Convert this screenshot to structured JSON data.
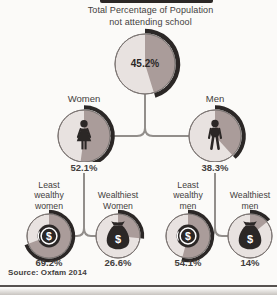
{
  "colors": {
    "bg": "#fbfaf8",
    "light": "#e8e2e0",
    "dark": "#aa9c9a",
    "arc": "#2b2726",
    "outline": "#7d7674",
    "line": "#928e8b",
    "text": "#433e3d",
    "icon-detail": "#ffffff"
  },
  "chart_data": {
    "type": "pie",
    "title_lines": "Total Percentage of Population\nnot attending school",
    "source_label": "Source: Oxfam 2014",
    "unit": "%",
    "legend": "dark wedge and black outer arc span the stated percentage, starting at 12 o'clock clockwise",
    "nodes": [
      {
        "id": "total",
        "label": "",
        "value": 45.2,
        "display": "45.2%",
        "icon": null
      },
      {
        "id": "women",
        "label": "Women",
        "value": 52.1,
        "display": "52.1%",
        "icon": "woman-icon"
      },
      {
        "id": "men",
        "label": "Men",
        "value": 38.3,
        "display": "38.3%",
        "icon": "man-icon"
      },
      {
        "id": "least-wealthy-women",
        "label": "Least\nwealthy\nwomen",
        "value": 69.2,
        "display": "69.2%",
        "icon": "coin-icon"
      },
      {
        "id": "wealthiest-women",
        "label": "Wealthiest\nWomen",
        "value": 26.6,
        "display": "26.6%",
        "icon": "moneybag-icon"
      },
      {
        "id": "least-wealthy-men",
        "label": "Least\nwealthy\nmen",
        "value": 54.1,
        "display": "54.1%",
        "icon": "coin-icon"
      },
      {
        "id": "wealthiest-men",
        "label": "Wealthiest\nmen",
        "value": 14,
        "display": "14%",
        "icon": "moneybag-icon"
      }
    ],
    "links": [
      [
        "total",
        "women"
      ],
      [
        "total",
        "men"
      ],
      [
        "women",
        "least-wealthy-women"
      ],
      [
        "women",
        "wealthiest-women"
      ],
      [
        "men",
        "least-wealthy-men"
      ],
      [
        "men",
        "wealthiest-men"
      ]
    ]
  }
}
